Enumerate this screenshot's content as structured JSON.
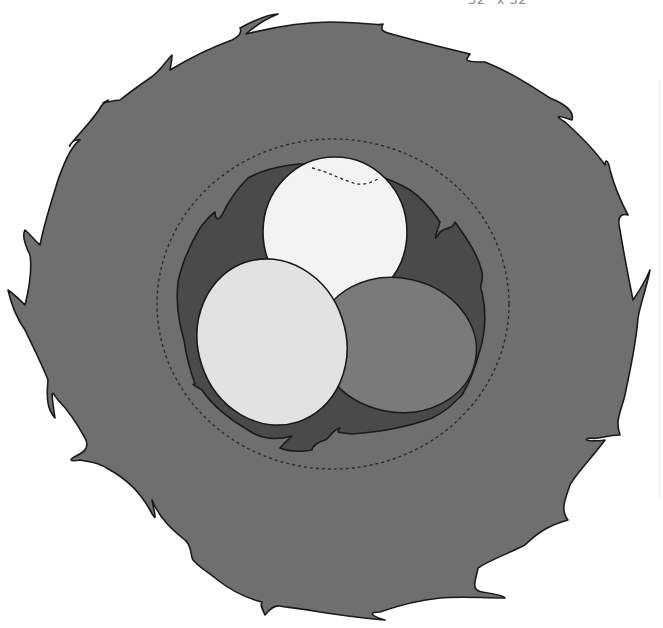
{
  "label": {
    "size_text": "32\" x 32\""
  },
  "illustration": {
    "subject": "bird nest with three eggs",
    "nest_outer_color": "#6f6f6f",
    "nest_inner_color": "#4a4a4a",
    "outline_color": "#1a1a1a",
    "dashed_ring_color": "#2a2a2a",
    "eggs": [
      {
        "name": "back-egg",
        "color": "#f3f3f3"
      },
      {
        "name": "left-egg",
        "color": "#e2e2e2"
      },
      {
        "name": "right-egg",
        "color": "#7a7a7a"
      }
    ]
  }
}
